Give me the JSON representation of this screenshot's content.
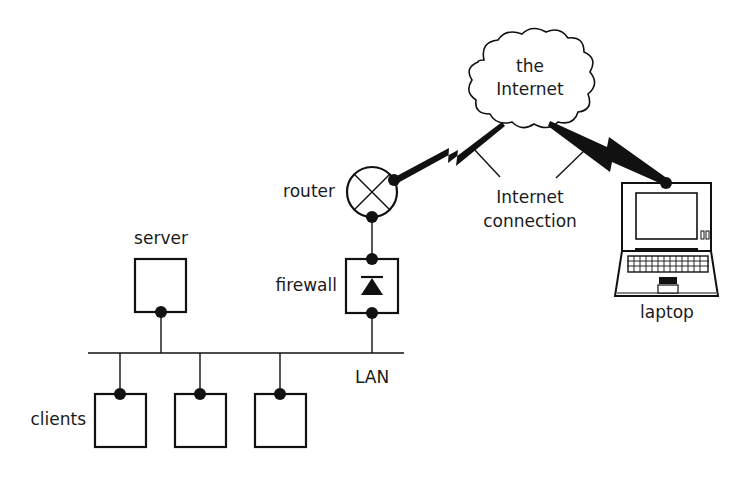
{
  "diagram": {
    "cloud": {
      "label_line1": "the",
      "label_line2": "Internet"
    },
    "connection_label": {
      "line1": "Internet",
      "line2": "connection"
    },
    "nodes": {
      "router": {
        "label": "router"
      },
      "firewall": {
        "label": "firewall"
      },
      "server": {
        "label": "server"
      },
      "laptop": {
        "label": "laptop"
      },
      "clients": {
        "label": "clients",
        "count": 3
      },
      "lan": {
        "label": "LAN"
      }
    },
    "edges": [
      {
        "from": "router",
        "to": "the Internet",
        "type": "wireless-lightning"
      },
      {
        "from": "laptop",
        "to": "the Internet",
        "type": "wireless-lightning"
      },
      {
        "from": "router",
        "to": "firewall",
        "type": "wired"
      },
      {
        "from": "firewall",
        "to": "LAN",
        "type": "wired"
      },
      {
        "from": "server",
        "to": "LAN",
        "type": "wired"
      },
      {
        "from": "client-1",
        "to": "LAN",
        "type": "wired"
      },
      {
        "from": "client-2",
        "to": "LAN",
        "type": "wired"
      },
      {
        "from": "client-3",
        "to": "LAN",
        "type": "wired"
      }
    ],
    "colors": {
      "ink": "#111111",
      "background": "#ffffff"
    }
  }
}
